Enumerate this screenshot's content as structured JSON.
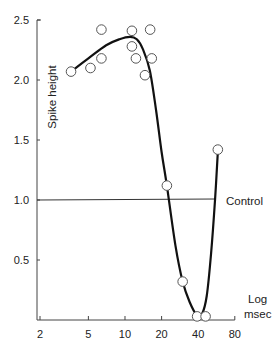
{
  "chart_data": {
    "type": "scatter",
    "title": "",
    "xlabel": "Log msec",
    "xlabel_lines": [
      "Log",
      "msec"
    ],
    "ylabel": "Spike height",
    "x_scale": "log",
    "xlim": [
      2,
      80
    ],
    "ylim": [
      0,
      2.5
    ],
    "x_ticks": [
      2,
      5,
      10,
      20,
      40,
      80
    ],
    "x_tick_labels": [
      "2",
      "5",
      "10",
      "20",
      "40",
      "80"
    ],
    "y_ticks": [
      0.5,
      1.0,
      1.5,
      2.0,
      2.5
    ],
    "y_tick_labels": [
      "0.5",
      "1.0",
      "1.5",
      "2.0",
      "2.5"
    ],
    "grid": false,
    "legend": null,
    "reference_line": {
      "label": "Control",
      "y": 1.0,
      "x_range": [
        2,
        55
      ]
    },
    "series": [
      {
        "name": "Observed spike height",
        "marker": "open-circle",
        "points": [
          {
            "x": 3.6,
            "y": 2.07
          },
          {
            "x": 5.2,
            "y": 2.1
          },
          {
            "x": 6.4,
            "y": 2.42
          },
          {
            "x": 6.4,
            "y": 2.18
          },
          {
            "x": 11.4,
            "y": 2.41
          },
          {
            "x": 11.4,
            "y": 2.28
          },
          {
            "x": 12.3,
            "y": 2.18
          },
          {
            "x": 14.6,
            "y": 2.04
          },
          {
            "x": 16.1,
            "y": 2.42
          },
          {
            "x": 16.6,
            "y": 2.18
          },
          {
            "x": 22.1,
            "y": 1.12
          },
          {
            "x": 29.8,
            "y": 0.32
          },
          {
            "x": 39.2,
            "y": 0.03
          },
          {
            "x": 46.0,
            "y": 0.03
          },
          {
            "x": 58.0,
            "y": 1.42
          }
        ]
      },
      {
        "name": "Fitted curve",
        "marker": "none",
        "line": "solid",
        "points": [
          {
            "x": 3.6,
            "y": 2.07
          },
          {
            "x": 5.0,
            "y": 2.18
          },
          {
            "x": 7.0,
            "y": 2.29
          },
          {
            "x": 9.0,
            "y": 2.34
          },
          {
            "x": 11.0,
            "y": 2.36
          },
          {
            "x": 12.5,
            "y": 2.34
          },
          {
            "x": 14.0,
            "y": 2.26
          },
          {
            "x": 16.0,
            "y": 2.08
          },
          {
            "x": 18.0,
            "y": 1.75
          },
          {
            "x": 20.0,
            "y": 1.4
          },
          {
            "x": 22.1,
            "y": 1.12
          },
          {
            "x": 26.0,
            "y": 0.62
          },
          {
            "x": 29.8,
            "y": 0.32
          },
          {
            "x": 34.0,
            "y": 0.15
          },
          {
            "x": 39.0,
            "y": 0.04
          },
          {
            "x": 43.0,
            "y": 0.05
          },
          {
            "x": 47.0,
            "y": 0.2
          },
          {
            "x": 51.0,
            "y": 0.55
          },
          {
            "x": 55.0,
            "y": 1.0
          },
          {
            "x": 58.0,
            "y": 1.4
          }
        ]
      }
    ]
  },
  "labels": {
    "y_axis_title": "Spike height",
    "x_axis_title_line1": "Log",
    "x_axis_title_line2": "msec",
    "control_label": "Control"
  },
  "colors": {
    "curve": "#111111",
    "axis": "#444444",
    "marker_stroke": "#555555",
    "marker_fill": "#ffffff"
  }
}
